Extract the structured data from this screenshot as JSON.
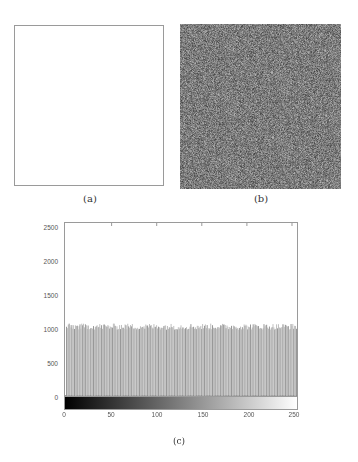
{
  "figure": {
    "panels": [
      {
        "id": "a",
        "caption": "(a)",
        "description": "all-white image"
      },
      {
        "id": "b",
        "caption": "(b)",
        "description": "random noise image"
      }
    ],
    "histogram_caption": "(c)"
  },
  "colors": {
    "axis": "#9a9a9a",
    "bar": "#b8b8b8",
    "bar_dark": "#8c8c8c",
    "noise_mean": "#7a7a7a"
  },
  "chart_data": {
    "type": "bar",
    "title": "",
    "xlabel": "",
    "ylabel": "",
    "xlim": [
      0,
      255
    ],
    "ylim": [
      0,
      2600
    ],
    "x_ticks": [
      "0",
      "50",
      "100",
      "150",
      "200",
      "250"
    ],
    "y_ticks": [
      "0",
      "500",
      "1000",
      "1500",
      "2000",
      "2500"
    ],
    "grid": false,
    "legend": null,
    "colorbar": "black-to-white gradient below x-axis",
    "categories_range": [
      0,
      255
    ],
    "value_mean": 1024,
    "value_range": [
      990,
      1080
    ]
  }
}
